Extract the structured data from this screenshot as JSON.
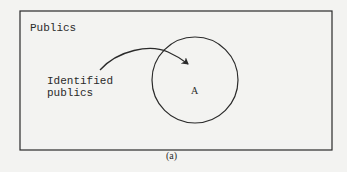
{
  "figure": {
    "caption": "(a)",
    "outer_set": {
      "label": "Publics"
    },
    "inner_set": {
      "label": "A"
    },
    "annotation": {
      "line1": "Identified",
      "line2": "publics"
    },
    "colors": {
      "background": "#f3f3f1",
      "stroke": "#2a2a2a",
      "text": "#2a2a2a"
    }
  }
}
